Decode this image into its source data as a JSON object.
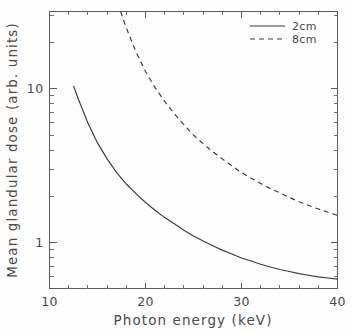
{
  "chart_data": {
    "type": "line",
    "title": "",
    "xlabel": "Photon energy (keV)",
    "ylabel": "Mean glandular dose (arb. units)",
    "xscale": "linear",
    "yscale": "log",
    "xlim": [
      10,
      40
    ],
    "ylim": [
      0.5,
      32
    ],
    "grid": false,
    "legend_position": "top-right",
    "xticks": [
      10,
      20,
      30,
      40
    ],
    "xtick_labels": [
      "10",
      "20",
      "30",
      "40"
    ],
    "yticks": [
      1,
      10
    ],
    "ytick_labels": [
      "1",
      "10"
    ],
    "yminor_ticks": [
      0.6,
      0.7,
      0.8,
      0.9,
      2,
      3,
      4,
      5,
      6,
      7,
      8,
      9,
      20,
      30
    ],
    "series": [
      {
        "name": "2cm",
        "style": "solid",
        "color": "#3c3c3c",
        "x": [
          12.5,
          13,
          14,
          15,
          16,
          17,
          18,
          19,
          20,
          21,
          22,
          23,
          24,
          25,
          26,
          27,
          28,
          29,
          30,
          31,
          32,
          33,
          34,
          35,
          36,
          37,
          38,
          39,
          40
        ],
        "y": [
          10.5,
          8.6,
          6.0,
          4.45,
          3.5,
          2.85,
          2.4,
          2.08,
          1.82,
          1.62,
          1.45,
          1.32,
          1.2,
          1.1,
          1.02,
          0.95,
          0.89,
          0.84,
          0.79,
          0.755,
          0.72,
          0.69,
          0.665,
          0.645,
          0.625,
          0.61,
          0.595,
          0.585,
          0.575
        ]
      },
      {
        "name": "8cm",
        "style": "dashed",
        "color": "#3c3c3c",
        "x": [
          17.4,
          18,
          19,
          20,
          21,
          22,
          23,
          24,
          25,
          26,
          27,
          28,
          29,
          30,
          31,
          32,
          33,
          34,
          35,
          36,
          37,
          38,
          39,
          40
        ],
        "y": [
          32.0,
          25.0,
          17.5,
          13.0,
          10.2,
          8.3,
          6.9,
          5.85,
          5.0,
          4.4,
          3.9,
          3.5,
          3.15,
          2.85,
          2.62,
          2.42,
          2.24,
          2.1,
          1.96,
          1.84,
          1.74,
          1.65,
          1.57,
          1.5
        ]
      }
    ]
  },
  "legend": {
    "entries": [
      {
        "label": "2cm",
        "style": "solid"
      },
      {
        "label": "8cm",
        "style": "dashed"
      }
    ]
  },
  "axes": {
    "x_title": "Photon energy (keV)",
    "y_title": "Mean glandular dose (arb. units)"
  }
}
